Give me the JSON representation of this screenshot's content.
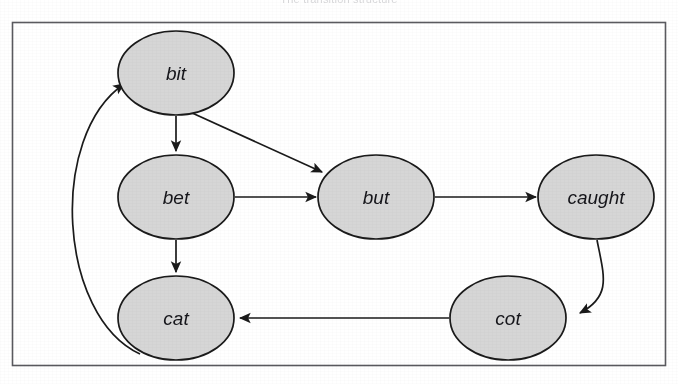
{
  "figure": {
    "caption": "The transition structure",
    "border_color": "#5a5a5f",
    "background_color": "#ffffff",
    "frame": {
      "x": 12,
      "y": 22,
      "width": 654,
      "height": 344
    }
  },
  "style": {
    "node_fill": "#d6d6d6",
    "node_stroke": "#1a1a1a",
    "edge_color": "#1a1a1a",
    "label_color": "#15151a"
  },
  "graph": {
    "type": "directed-graph",
    "node_shape": "ellipse",
    "nodes": [
      {
        "id": "bit",
        "label": "bit",
        "cx": 176,
        "cy": 73,
        "rx": 58,
        "ry": 42
      },
      {
        "id": "bet",
        "label": "bet",
        "cx": 176,
        "cy": 197,
        "rx": 58,
        "ry": 42
      },
      {
        "id": "but",
        "label": "but",
        "cx": 376,
        "cy": 197,
        "rx": 58,
        "ry": 42
      },
      {
        "id": "caught",
        "label": "caught",
        "cx": 596,
        "cy": 197,
        "rx": 58,
        "ry": 42
      },
      {
        "id": "cot",
        "label": "cot",
        "cx": 508,
        "cy": 318,
        "rx": 58,
        "ry": 42
      },
      {
        "id": "cat",
        "label": "cat",
        "cx": 176,
        "cy": 318,
        "rx": 58,
        "ry": 42
      }
    ],
    "edges": [
      {
        "from": "bit",
        "to": "bet",
        "shape": "straight"
      },
      {
        "from": "bit",
        "to": "but",
        "shape": "straight"
      },
      {
        "from": "bet",
        "to": "but",
        "shape": "straight"
      },
      {
        "from": "bet",
        "to": "cat",
        "shape": "straight"
      },
      {
        "from": "but",
        "to": "caught",
        "shape": "straight"
      },
      {
        "from": "caught",
        "to": "cot",
        "shape": "curved"
      },
      {
        "from": "cot",
        "to": "cat",
        "shape": "straight"
      },
      {
        "from": "cat",
        "to": "bit",
        "shape": "curved"
      }
    ]
  }
}
